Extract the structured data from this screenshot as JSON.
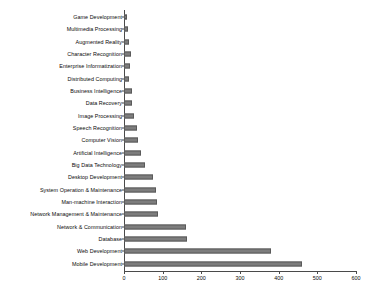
{
  "chart_data": {
    "type": "bar",
    "orientation": "horizontal",
    "title": "",
    "subtitle": "",
    "xlabel": "",
    "ylabel": "",
    "xlim": [
      0,
      600
    ],
    "xticks": [
      0,
      100,
      200,
      300,
      400,
      500,
      600
    ],
    "xtick_labels": [
      "0",
      "100",
      "200",
      "300",
      "400",
      "500",
      "600"
    ],
    "grid": false,
    "legend": null,
    "bar_color": "#7d7d7d",
    "bar_edge_color": "#5a5a5a",
    "axis_color": "#4a4a4a",
    "categories": [
      "Game Development",
      "Multimedia Processing",
      "Augmented Reality",
      "Character Recognition",
      "Enterprise Informatization",
      "Distributed Computing",
      "Business Intelligence",
      "Data Recovery",
      "Image Processing",
      "Speech Recognition",
      "Computer Vision",
      "Artificial Intelligence",
      "Big Data Technology",
      "Desktop Development",
      "System Operation & Maintenance",
      "Man-machine Interaction",
      "Network Management & Maintenance",
      "Network & Communication",
      "Database",
      "Web Development",
      "Mobile Development"
    ],
    "values": [
      8,
      10,
      13,
      18,
      15,
      13,
      20,
      21,
      25,
      33,
      37,
      44,
      55,
      74,
      82,
      85,
      88,
      160,
      163,
      380,
      460
    ]
  }
}
